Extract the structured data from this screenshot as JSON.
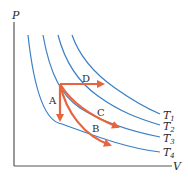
{
  "diagram": {
    "title": "",
    "axes": {
      "x_label": "V",
      "y_label": "P"
    },
    "isotherms": [
      {
        "label": "T",
        "subscript": "1"
      },
      {
        "label": "T",
        "subscript": "2"
      },
      {
        "label": "T",
        "subscript": "3"
      },
      {
        "label": "T",
        "subscript": "4"
      }
    ],
    "processes": [
      {
        "label": "A",
        "description": "isochoric drop to T4"
      },
      {
        "label": "B",
        "description": "curved path to T4"
      },
      {
        "label": "C",
        "description": "curved path to T3"
      },
      {
        "label": "D",
        "description": "isobaric expansion to T1"
      }
    ],
    "colors": {
      "isotherm": "#3b7fc4",
      "process": "#e8643c",
      "axis": "#555555"
    }
  }
}
